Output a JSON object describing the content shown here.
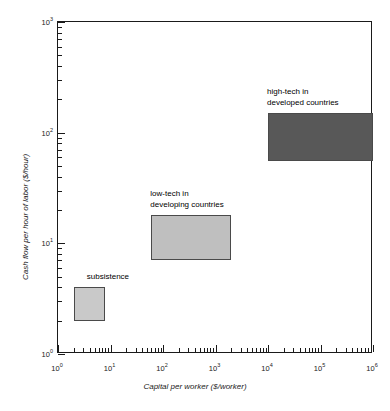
{
  "chart_data": {
    "type": "scatter",
    "title": "",
    "xlabel": "Capital per worker ($/worker)",
    "ylabel": "Cash flow per hour of labor ($/hour)",
    "xscale": "log",
    "yscale": "log",
    "xlim": [
      1,
      1000000
    ],
    "ylim": [
      1,
      1000
    ],
    "grid": false,
    "legend": "none",
    "xticks": [
      {
        "value": 1,
        "label": "10",
        "exponent": "0"
      },
      {
        "value": 10,
        "label": "10",
        "exponent": "1"
      },
      {
        "value": 100,
        "label": "10",
        "exponent": "2"
      },
      {
        "value": 1000,
        "label": "10",
        "exponent": "3"
      },
      {
        "value": 10000,
        "label": "10",
        "exponent": "4"
      },
      {
        "value": 100000,
        "label": "10",
        "exponent": "5"
      },
      {
        "value": 1000000,
        "label": "10",
        "exponent": "6"
      }
    ],
    "yticks": [
      {
        "value": 1,
        "label": "10",
        "exponent": "0"
      },
      {
        "value": 10,
        "label": "10",
        "exponent": "1"
      },
      {
        "value": 100,
        "label": "10",
        "exponent": "2"
      },
      {
        "value": 1000,
        "label": "10",
        "exponent": "3"
      }
    ],
    "regions": [
      {
        "name": "subsistence",
        "label": "subsistence",
        "x_range": [
          2,
          8
        ],
        "y_range": [
          2,
          4
        ],
        "fill": "#c9c9c9",
        "stroke": "#4a4a4a"
      },
      {
        "name": "low-tech in developing countries",
        "label": "low-tech in\ndeveloping countries",
        "x_range": [
          60,
          2000
        ],
        "y_range": [
          7,
          18
        ],
        "fill": "#bfbfbf",
        "stroke": "#4a4a4a"
      },
      {
        "name": "high-tech in developed countries",
        "label": "high-tech in\ndeveloped countries",
        "x_range": [
          10000,
          1000000
        ],
        "y_range": [
          55,
          150
        ],
        "fill": "#585858",
        "stroke": "#4a4a4a"
      }
    ]
  },
  "axes": {
    "x_title": "Capital per worker ($/worker)",
    "y_title": "Cash flow per hour of labor ($/hour)"
  },
  "regions": {
    "subsistence": {
      "label": "subsistence"
    },
    "low_tech": {
      "line1": "low-tech in",
      "line2": "developing countries"
    },
    "high_tech": {
      "line1": "high-tech in",
      "line2": "developed countries"
    }
  }
}
